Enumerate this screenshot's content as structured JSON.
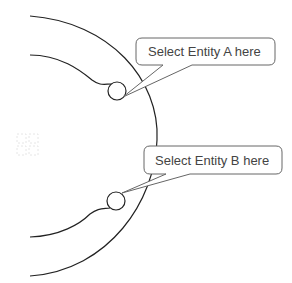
{
  "diagram": {
    "callouts": [
      {
        "id": "entity-a",
        "label": "Select Entity A here"
      },
      {
        "id": "entity-b",
        "label": "Select Entity B here"
      }
    ],
    "colors": {
      "stroke": "#222222",
      "callout_border": "#666666",
      "text": "#444444",
      "background": "#ffffff",
      "grid_icon": "#eeeeee"
    }
  }
}
